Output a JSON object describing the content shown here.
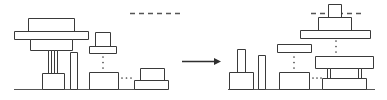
{
  "figure": {
    "type": "schematic-transformation",
    "title": "",
    "stroke_color": "#3a3a3a",
    "ground_color": "#555555",
    "fill_color": "#ffffff",
    "background_color": "#ffffff",
    "arrow": {
      "label": "",
      "direction": "right",
      "x1": 182,
      "x2": 221,
      "y": 61
    },
    "ellipsis_glyphs": {
      "vertical": "⋮",
      "horizontal": "…"
    }
  },
  "left_panel": {
    "name": "before-state",
    "ground": {
      "x1": 14,
      "x2": 168,
      "y": 89
    },
    "dashed_line": {
      "x1": 130,
      "x2": 182,
      "y": 13
    },
    "structures": [
      {
        "name": "tall-wide-table",
        "parts": [
          {
            "name": "top-slab",
            "x": 28,
            "y": 18,
            "w": 46,
            "h": 13
          },
          {
            "name": "wide-deck",
            "x": 14,
            "y": 31,
            "w": 74,
            "h": 8
          },
          {
            "name": "under-slab",
            "x": 30,
            "y": 39,
            "w": 42,
            "h": 11
          },
          {
            "name": "left-leg",
            "x": 48,
            "y": 50,
            "w": 3,
            "h": 23
          },
          {
            "name": "right-leg",
            "x": 54,
            "y": 50,
            "w": 3,
            "h": 23
          },
          {
            "name": "base-block",
            "x": 42,
            "y": 73,
            "w": 22,
            "h": 16
          }
        ]
      },
      {
        "name": "thin-pillar",
        "parts": [
          {
            "name": "pillar",
            "x": 70,
            "y": 52,
            "w": 7,
            "h": 37
          }
        ]
      },
      {
        "name": "small-capped-stack",
        "parts": [
          {
            "name": "cap-block",
            "x": 95,
            "y": 32,
            "w": 15,
            "h": 14
          },
          {
            "name": "cap-slab",
            "x": 89,
            "y": 46,
            "w": 27,
            "h": 7
          },
          {
            "name": "base-block",
            "x": 89,
            "y": 72,
            "w": 29,
            "h": 17
          }
        ],
        "vertical_ellipsis": {
          "x": 103,
          "y1": 57,
          "y2": 68,
          "count": 3
        }
      },
      {
        "name": "stepped-stack",
        "parts": [
          {
            "name": "upper-block",
            "x": 140,
            "y": 68,
            "w": 24,
            "h": 12
          },
          {
            "name": "lower-block",
            "x": 134,
            "y": 80,
            "w": 34,
            "h": 9
          }
        ],
        "horizontal_ellipsis": {
          "y": 78,
          "x1": 122,
          "x2": 131,
          "count": 3
        }
      }
    ]
  },
  "right_panel": {
    "name": "after-state",
    "ground": {
      "x1": 228,
      "x2": 375,
      "y": 89
    },
    "dashed_line": {
      "x1": 311,
      "x2": 363,
      "y": 13
    },
    "structures": [
      {
        "name": "floating-capped-platform",
        "parts": [
          {
            "name": "cap-block",
            "x": 328,
            "y": 4,
            "w": 13,
            "h": 13
          },
          {
            "name": "mid-block",
            "x": 318,
            "y": 17,
            "w": 33,
            "h": 13
          },
          {
            "name": "wide-deck",
            "x": 300,
            "y": 30,
            "w": 70,
            "h": 8
          }
        ],
        "vertical_ellipsis": {
          "x": 336,
          "y1": 41,
          "y2": 52,
          "count": 3
        }
      },
      {
        "name": "double-pillar-base",
        "parts": [
          {
            "name": "tall-pillar",
            "x": 237,
            "y": 49,
            "w": 8,
            "h": 28
          },
          {
            "name": "base-block",
            "x": 229,
            "y": 72,
            "w": 24,
            "h": 17
          },
          {
            "name": "thin-pillar",
            "x": 258,
            "y": 55,
            "w": 7,
            "h": 34
          }
        ]
      },
      {
        "name": "floating-bar-over-block",
        "parts": [
          {
            "name": "floating-bar",
            "x": 277,
            "y": 44,
            "w": 34,
            "h": 8
          },
          {
            "name": "base-block",
            "x": 279,
            "y": 72,
            "w": 30,
            "h": 17
          }
        ],
        "vertical_ellipsis": {
          "x": 294,
          "y1": 57,
          "y2": 68,
          "count": 3
        }
      },
      {
        "name": "wide-table",
        "parts": [
          {
            "name": "top-slab",
            "x": 315,
            "y": 56,
            "w": 58,
            "h": 12
          },
          {
            "name": "left-leg",
            "x": 327,
            "y": 68,
            "w": 3,
            "h": 10
          },
          {
            "name": "right-leg",
            "x": 358,
            "y": 68,
            "w": 3,
            "h": 10
          },
          {
            "name": "base-block",
            "x": 322,
            "y": 78,
            "w": 44,
            "h": 11
          }
        ],
        "horizontal_ellipsis": {
          "y": 78,
          "x1": 313,
          "x2": 321,
          "count": 3
        }
      }
    ]
  }
}
